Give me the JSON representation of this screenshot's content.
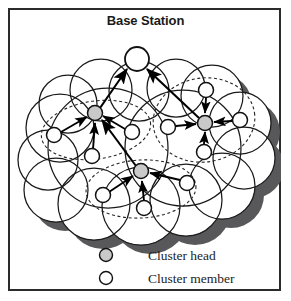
{
  "figure": {
    "title": "Base Station",
    "kind": "wireless-sensor-network-clustering-diagram",
    "background_color": "#ffffff",
    "frame_color": "#2b2b2b"
  },
  "colors": {
    "cluster_head_fill": "#c9c9c9",
    "cluster_member_fill": "#ffffff",
    "node_stroke": "#111111",
    "cloud_fill": "#ffffff",
    "cloud_stroke": "#1a1a1a",
    "cloud_shadow": "#58585a",
    "dashed_boundary": "#262626",
    "arrow_color": "#000000",
    "text_color": "#1d1d1d"
  },
  "base_station": {
    "label": "Base Station",
    "node_name": "base-station-node",
    "cx": 129,
    "cy": 51,
    "r": 12
  },
  "clusters": [
    {
      "name": "left-cluster",
      "head": {
        "cx": 87,
        "cy": 105,
        "r": 7.5,
        "type": "cluster_head"
      },
      "boundary": {
        "cx": 88,
        "cy": 122,
        "rx": 55,
        "ry": 30,
        "rotate": -8
      },
      "members": [
        {
          "name": "left-cluster-member-1",
          "cx": 46,
          "cy": 127,
          "r": 7.5
        },
        {
          "name": "left-cluster-member-2",
          "cx": 84,
          "cy": 148,
          "r": 7.5
        },
        {
          "name": "left-cluster-member-3",
          "cx": 124,
          "cy": 124,
          "r": 7.5
        }
      ]
    },
    {
      "name": "right-cluster",
      "head": {
        "cx": 197,
        "cy": 115,
        "r": 7.5,
        "type": "cluster_head"
      },
      "boundary": {
        "cx": 196,
        "cy": 112,
        "rx": 52,
        "ry": 42,
        "rotate": -8
      },
      "members": [
        {
          "name": "right-cluster-member-1",
          "cx": 198,
          "cy": 82,
          "r": 7.5
        },
        {
          "name": "right-cluster-member-2",
          "cx": 232,
          "cy": 112,
          "r": 7.5
        },
        {
          "name": "right-cluster-member-3",
          "cx": 160,
          "cy": 119,
          "r": 7.5
        },
        {
          "name": "right-cluster-member-4",
          "cx": 196,
          "cy": 144,
          "r": 7.5
        }
      ]
    },
    {
      "name": "bottom-cluster",
      "head": {
        "cx": 133,
        "cy": 163,
        "r": 7.5,
        "type": "cluster_head"
      },
      "boundary": {
        "cx": 133,
        "cy": 182,
        "rx": 55,
        "ry": 30,
        "rotate": -3
      },
      "members": [
        {
          "name": "bottom-cluster-member-1",
          "cx": 95,
          "cy": 187,
          "r": 7.5
        },
        {
          "name": "bottom-cluster-member-2",
          "cx": 136,
          "cy": 200,
          "r": 7.5
        },
        {
          "name": "bottom-cluster-member-3",
          "cx": 179,
          "cy": 175,
          "r": 7.5
        }
      ]
    }
  ],
  "links": [
    {
      "name": "link-left-head-to-base-station",
      "from": "left-cluster-head",
      "to": "base-station"
    },
    {
      "name": "link-right-head-to-base-station",
      "from": "right-cluster-head",
      "to": "base-station"
    },
    {
      "name": "link-bottom-head-to-left-head",
      "from": "bottom-cluster-head",
      "to": "left-cluster-head"
    }
  ],
  "legend": {
    "name": "legend",
    "items": [
      {
        "name": "legend-item-cluster-head",
        "label": "Cluster head",
        "marker": "cluster-head-circle-icon",
        "fill": "#c9c9c9"
      },
      {
        "name": "legend-item-cluster-member",
        "label": "Cluster member",
        "marker": "cluster-member-circle-icon",
        "fill": "#ffffff"
      }
    ]
  }
}
